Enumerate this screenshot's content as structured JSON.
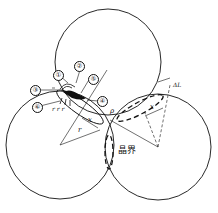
{
  "diagram": {
    "type": "sintering-neck-three-particles",
    "particles": 3,
    "callouts": [
      {
        "id": "1",
        "label": "①"
      },
      {
        "id": "2",
        "label": "②"
      },
      {
        "id": "3",
        "label": "③"
      },
      {
        "id": "4",
        "label": "④"
      },
      {
        "id": "5",
        "label": "⑤"
      },
      {
        "id": "6",
        "label": "⑥"
      }
    ],
    "symbols": {
      "rho": "ρ",
      "x_left": "x",
      "x_right": "x",
      "r_radius": "r",
      "r_small": "r r r",
      "delta_l": "ΔL"
    },
    "grain_boundary_label": "晶界"
  }
}
